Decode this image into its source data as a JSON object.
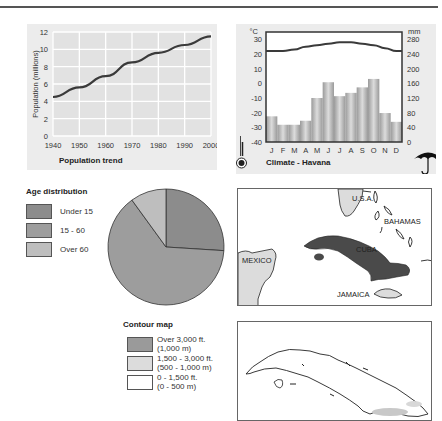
{
  "chart_data": [
    {
      "type": "line",
      "title": "Population trend",
      "xlabel": "",
      "ylabel": "Population (millions)",
      "x": [
        1940,
        1950,
        1960,
        1970,
        1980,
        1990,
        2000
      ],
      "values": [
        4.5,
        5.6,
        6.9,
        8.5,
        9.6,
        10.5,
        11.5
      ],
      "xticks": [
        "1940",
        "1950",
        "1960",
        "1970",
        "1980",
        "1990",
        "2000"
      ],
      "yticks": [
        "0",
        "2",
        "4",
        "6",
        "8",
        "10",
        "12"
      ],
      "xlim": [
        1940,
        2000
      ],
      "ylim": [
        0,
        12
      ],
      "grid": true
    },
    {
      "type": "bar",
      "title": "Climate - Havana",
      "categories": [
        "J",
        "F",
        "M",
        "A",
        "M",
        "J",
        "J",
        "A",
        "S",
        "O",
        "N",
        "D"
      ],
      "series": [
        {
          "name": "Rainfall (mm)",
          "type": "bar",
          "axis": "right",
          "values": [
            70,
            47,
            47,
            58,
            120,
            163,
            125,
            134,
            149,
            172,
            79,
            55
          ]
        },
        {
          "name": "Temperature (°C)",
          "type": "line",
          "axis": "left",
          "values": [
            22,
            22,
            23,
            25,
            26,
            27,
            28,
            28,
            27,
            26,
            24,
            22
          ]
        }
      ],
      "left_axis": {
        "unit": "°C",
        "ticks": [
          "30",
          "20",
          "10",
          "0",
          "-10",
          "-20",
          "-30",
          "-40"
        ],
        "ylim": [
          -40,
          35
        ]
      },
      "right_axis": {
        "unit": "mm",
        "ticks": [
          "280",
          "240",
          "200",
          "160",
          "120",
          "80",
          "40",
          "0"
        ],
        "ylim": [
          0,
          300
        ]
      },
      "grid": false
    },
    {
      "type": "pie",
      "title": "Age distribution",
      "categories": [
        "Under 15",
        "15 - 60",
        "Over 60"
      ],
      "values": [
        26,
        64,
        10
      ],
      "legend": "left"
    }
  ],
  "colors": {
    "panel_bg": "#ececec",
    "grid": "#ffffff",
    "line": "#3a3a3a",
    "bar": "#b8b8b8",
    "pie": [
      "#8c8c8c",
      "#9d9d9d",
      "#bebebe"
    ],
    "cuba": "#4a4a4a",
    "land_light": "#dcdcdc"
  },
  "age_legend": {
    "title": "Age distribution",
    "items": [
      {
        "label": "Under 15"
      },
      {
        "label": "15 - 60"
      },
      {
        "label": "Over 60"
      }
    ]
  },
  "contour_legend": {
    "title": "Contour map",
    "items": [
      {
        "line1": "Over 3,000 ft.",
        "line2": "(1,000 m)"
      },
      {
        "line1": "1,500 - 3,000 ft.",
        "line2": "(500 - 1,000 m)"
      },
      {
        "line1": "0 - 1,500 ft.",
        "line2": "(0 - 500 m)"
      }
    ]
  },
  "locator_map": {
    "labels": {
      "usa": "U.S.A.",
      "bahamas": "BAHAMAS",
      "cuba": "CUBA",
      "mexico": "MEXICO",
      "jamaica": "JAMAICA"
    }
  },
  "icons": {
    "thermometer": "thermometer-icon",
    "umbrella": "umbrella-icon"
  }
}
